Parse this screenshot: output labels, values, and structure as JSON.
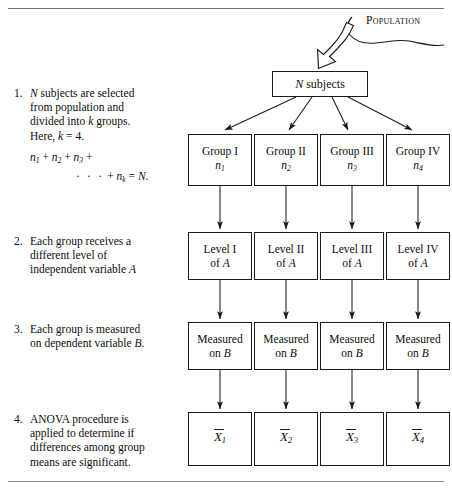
{
  "figure": {
    "population_label": "Population",
    "top_box": {
      "line1": "N subjects",
      "n_symbol": "N",
      "word": "subjects"
    }
  },
  "steps": [
    {
      "number": "1.",
      "text_line1_a": "N",
      "text_line1_b": " subjects are selected",
      "text_line2": "from population and",
      "text_line3_a": "divided into ",
      "text_line3_b": "k",
      "text_line3_c": " groups.",
      "text_line4_a": "Here, ",
      "text_line4_b": "k",
      "text_line4_c": " = 4.",
      "formula_line1": "n",
      "formula_sub1": "1",
      "formula_plus1": " + ",
      "formula_n2": "n",
      "formula_sub2": "2",
      "formula_plus2": " + ",
      "formula_n3": "n",
      "formula_sub3": "3",
      "formula_plus3": " +",
      "formula_dots": "· · ·",
      "formula_plus4": " + ",
      "formula_nk": "n",
      "formula_subk": "k",
      "formula_eq": " = ",
      "formula_N": "N",
      "formula_period": "."
    },
    {
      "number": "2.",
      "text_line1": "Each group receives a",
      "text_line2": "different level of",
      "text_line3_a": "independent variable ",
      "text_line3_b": "A"
    },
    {
      "number": "3.",
      "text_line1": "Each group is measured",
      "text_line2_a": "on dependent variable ",
      "text_line2_b": "B",
      "text_line2_c": "."
    },
    {
      "number": "4.",
      "text_line1": "ANOVA procedure is",
      "text_line2": "applied to determine if",
      "text_line3": "differences among group",
      "text_line4": "means are significant."
    }
  ],
  "rows": {
    "groups": [
      {
        "label": "Group I",
        "n_symbol": "n",
        "n_sub": "1"
      },
      {
        "label": "Group II",
        "n_symbol": "n",
        "n_sub": "2"
      },
      {
        "label": "Group III",
        "n_symbol": "n",
        "n_sub": "3"
      },
      {
        "label": "Group IV",
        "n_symbol": "n",
        "n_sub": "4"
      }
    ],
    "levels": [
      {
        "line1": "Level I",
        "line2_a": "of ",
        "line2_b": "A"
      },
      {
        "line1": "Level II",
        "line2_a": "of ",
        "line2_b": "A"
      },
      {
        "line1": "Level III",
        "line2_a": "of ",
        "line2_b": "A"
      },
      {
        "line1": "Level IV",
        "line2_a": "of ",
        "line2_b": "A"
      }
    ],
    "measured": [
      {
        "line1": "Measured",
        "line2_a": "on ",
        "line2_b": "B"
      },
      {
        "line1": "Measured",
        "line2_a": "on ",
        "line2_b": "B"
      },
      {
        "line1": "Measured",
        "line2_a": "on ",
        "line2_b": "B"
      },
      {
        "line1": "Measured",
        "line2_a": "on ",
        "line2_b": "B"
      }
    ],
    "means": [
      {
        "symbol": "X",
        "sub": "1"
      },
      {
        "symbol": "X",
        "sub": "2"
      },
      {
        "symbol": "X",
        "sub": "3"
      },
      {
        "symbol": "X",
        "sub": "4"
      }
    ]
  },
  "colors": {
    "ink": "#1a1a1a",
    "rule": "#8d8d8d",
    "background": "#ffffff"
  }
}
